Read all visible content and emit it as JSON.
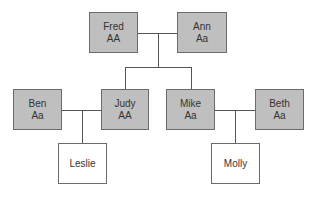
{
  "diagram": {
    "type": "family-pedigree",
    "colors": {
      "shaded_fill": "#bfbfbf",
      "unshaded_fill": "#ffffff",
      "border": "#6b6b6b",
      "line": "#555555",
      "text": "#333333"
    },
    "generations": [
      {
        "level": 1,
        "people": [
          {
            "id": "fred",
            "name": "Fred",
            "genotype": "AA",
            "shaded": true
          },
          {
            "id": "ann",
            "name": "Ann",
            "genotype": "Aa",
            "shaded": true
          }
        ]
      },
      {
        "level": 2,
        "people": [
          {
            "id": "ben",
            "name": "Ben",
            "genotype": "Aa",
            "shaded": true
          },
          {
            "id": "judy",
            "name": "Judy",
            "genotype": "AA",
            "shaded": true
          },
          {
            "id": "mike",
            "name": "Mike",
            "genotype": "Aa",
            "shaded": true
          },
          {
            "id": "beth",
            "name": "Beth",
            "genotype": "Aa",
            "shaded": true
          }
        ]
      },
      {
        "level": 3,
        "people": [
          {
            "id": "leslie",
            "name": "Leslie",
            "genotype": "",
            "shaded": false
          },
          {
            "id": "molly",
            "name": "Molly",
            "genotype": "",
            "shaded": false
          }
        ]
      }
    ],
    "couples": [
      {
        "partners": [
          "fred",
          "ann"
        ],
        "children": [
          "judy",
          "mike"
        ]
      },
      {
        "partners": [
          "ben",
          "judy"
        ],
        "children": [
          "leslie"
        ]
      },
      {
        "partners": [
          "mike",
          "beth"
        ],
        "children": [
          "molly"
        ]
      }
    ]
  }
}
